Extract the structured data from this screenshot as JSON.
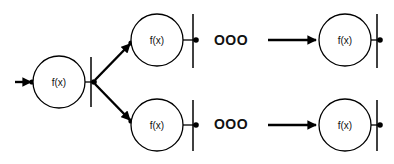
{
  "diagram": {
    "type": "chain-of-functions",
    "nodes": [
      {
        "id": "n1",
        "label": "f(x)",
        "cx": 59,
        "cy": 82,
        "r": 26
      },
      {
        "id": "n2",
        "label": "f(x)",
        "cx": 157,
        "cy": 40,
        "r": 26
      },
      {
        "id": "n3",
        "label": "f(x)",
        "cx": 345,
        "cy": 40,
        "r": 26
      },
      {
        "id": "n4",
        "label": "f(x)",
        "cx": 157,
        "cy": 125,
        "r": 26
      },
      {
        "id": "n5",
        "label": "f(x)",
        "cx": 345,
        "cy": 125,
        "r": 26
      }
    ],
    "ellipses": [
      {
        "label": "OOO",
        "x": 231,
        "y": 41
      },
      {
        "label": "OOO",
        "x": 231,
        "y": 125
      }
    ],
    "edges": [
      {
        "from": "input",
        "to": "n1"
      },
      {
        "from": "n1",
        "to": "n2"
      },
      {
        "from": "n1",
        "to": "n4"
      },
      {
        "from": "n2",
        "to": "ellipsis-top"
      },
      {
        "from": "ellipsis-top",
        "to": "n3"
      },
      {
        "from": "n4",
        "to": "ellipsis-bottom"
      },
      {
        "from": "ellipsis-bottom",
        "to": "n5"
      }
    ],
    "colors": {
      "stroke": "#000000",
      "background": "#ffffff"
    }
  }
}
